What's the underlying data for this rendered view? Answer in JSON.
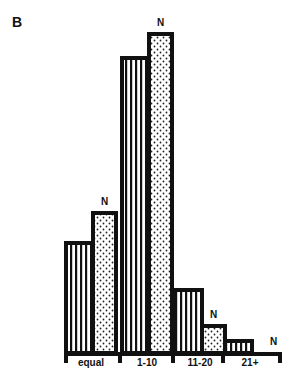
{
  "panel_label": "B",
  "chart_data": {
    "type": "bar",
    "title": "",
    "xlabel": "",
    "ylabel": "",
    "categories": [
      "equal",
      "1-10",
      "11-20",
      "21+"
    ],
    "series": [
      {
        "name": "striped",
        "pattern": "vertical-lines",
        "values": [
          110,
          295,
          63,
          12
        ]
      },
      {
        "name": "N",
        "pattern": "dots",
        "values": [
          140,
          319,
          27,
          0
        ]
      }
    ],
    "annotations": [
      "N",
      "N",
      "N",
      "N"
    ],
    "ylim": [
      0,
      330
    ],
    "grid": false,
    "legend": "none",
    "units": "relative bar height (px, no axis shown)"
  }
}
